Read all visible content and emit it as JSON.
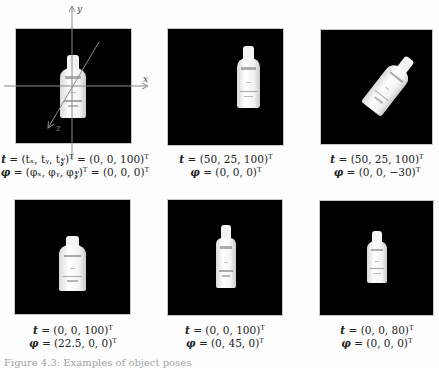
{
  "figure": {
    "panels": [
      {
        "id": "reference-pose",
        "has_axes": true,
        "axes": {
          "x_label": "x",
          "y_label": "y",
          "z_label": "z"
        },
        "t_line": {
          "symbol": "t",
          "expr": " = (t",
          "full": "t = (tₓ, t_y, t_z)ᵀ = (0, 0, 100)ᵀ",
          "lhs": "= (tₓ, tᵧ, t𝓏)",
          "rhs": " = (0, 0, 100)"
        },
        "phi_line": {
          "symbol": "φ",
          "full": "φ = (φₓ, φ_y, φ_z)ᵀ = (0, 0, 0)ᵀ",
          "lhs": "= (φₓ, φᵧ, φ𝓏)",
          "rhs": " = (0, 0, 0)"
        }
      },
      {
        "id": "translated",
        "t_line": {
          "symbol": "t",
          "rhs": "= (50, 25, 100)"
        },
        "phi_line": {
          "symbol": "φ",
          "rhs": "= (0, 0, 0)"
        }
      },
      {
        "id": "translated-rotated-z",
        "t_line": {
          "symbol": "t",
          "rhs": "= (50, 25, 100)"
        },
        "phi_line": {
          "symbol": "φ",
          "rhs": "= (0, 0, −30)"
        }
      },
      {
        "id": "rotated-x",
        "t_line": {
          "symbol": "t",
          "rhs": "= (0, 0, 100)"
        },
        "phi_line": {
          "symbol": "φ",
          "rhs": "= (22.5, 0, 0)"
        }
      },
      {
        "id": "rotated-y",
        "t_line": {
          "symbol": "t",
          "rhs": "= (0, 0, 100)"
        },
        "phi_line": {
          "symbol": "φ",
          "rhs": "= (0, 45, 0)"
        }
      },
      {
        "id": "closer",
        "t_line": {
          "symbol": "t",
          "rhs": "= (0, 0, 80)"
        },
        "phi_line": {
          "symbol": "φ",
          "rhs": "= (0, 0, 0)"
        }
      }
    ],
    "transpose_symbol": "T",
    "caption": "Figure 4.3: Examples of object poses"
  }
}
